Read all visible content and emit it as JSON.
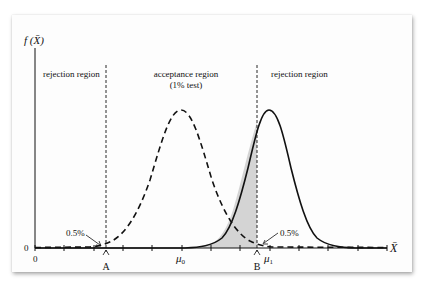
{
  "diagram": {
    "y_axis_label": "f (X̄)",
    "x_axis_label": "X̄",
    "origin_y_label": "0",
    "origin_x_label": "0",
    "regions": {
      "left": "rejection region",
      "middle_line1": "acceptance region",
      "middle_line2": "(1% test)",
      "right": "rejection region"
    },
    "markers": {
      "A": "A",
      "B": "B",
      "mu0": "μ",
      "mu0_sub": "0",
      "mu1": "μ",
      "mu1_sub": "1"
    },
    "annotations": {
      "left_tail": "0.5%",
      "right_tail": "0.5%"
    },
    "curves": [
      {
        "name": "null distribution (mean μ0)",
        "style": "dashed"
      },
      {
        "name": "alternative distribution (mean μ1)",
        "style": "solid"
      }
    ],
    "shaded_area": "area under solid curve left of B (acceptance region)",
    "colors": {
      "line": "#111111",
      "shade": "#d4d4d4",
      "card": "#fdfdfd"
    }
  }
}
